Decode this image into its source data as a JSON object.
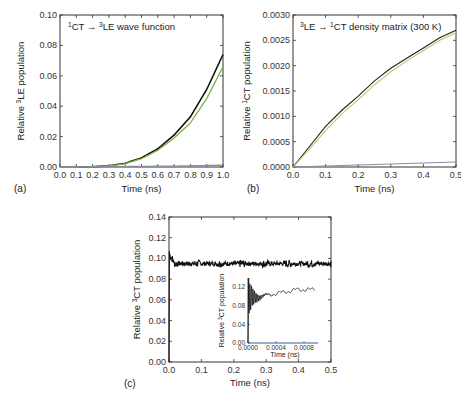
{
  "chart_data": [
    {
      "panel": "(a)",
      "type": "line",
      "title": "1CT → 3LE wave function",
      "title_parts": {
        "sup1": "1",
        "main1": "CT",
        "arrow": "→",
        "sup2": "3",
        "main2": "LE wave function"
      },
      "xlabel": "Time (ns)",
      "ylabel": "Relative 3LE population",
      "ylabel_parts": {
        "pre": "Relative ",
        "sup": "3",
        "post": "LE population"
      },
      "xlim": [
        0.0,
        1.0
      ],
      "ylim": [
        0.0,
        0.1
      ],
      "xticks": [
        "0.0",
        "0.1",
        "0.2",
        "0.3",
        "0.4",
        "0.5",
        "0.6",
        "0.7",
        "0.8",
        "0.9",
        "1.0"
      ],
      "yticks": [
        "0.00",
        "0.02",
        "0.04",
        "0.06",
        "0.08",
        "0.10"
      ],
      "grid": false,
      "x": [
        0.0,
        0.1,
        0.2,
        0.3,
        0.4,
        0.5,
        0.6,
        0.7,
        0.8,
        0.9,
        1.0
      ],
      "series": [
        {
          "name": "black",
          "color": "#111111",
          "values": [
            0.0,
            0.0,
            0.0002,
            0.0008,
            0.0025,
            0.006,
            0.012,
            0.021,
            0.033,
            0.051,
            0.074
          ]
        },
        {
          "name": "green",
          "color": "#7cb342",
          "values": [
            0.0,
            0.0,
            0.0002,
            0.0007,
            0.0022,
            0.0055,
            0.011,
            0.019,
            0.029,
            0.045,
            0.066
          ]
        },
        {
          "name": "gray-baseline",
          "color": "#8a8fa0",
          "values": [
            0.0,
            0.0,
            0.0001,
            0.0002,
            0.0003,
            0.0004,
            0.0005,
            0.0006,
            0.0008,
            0.001,
            0.0012
          ]
        }
      ]
    },
    {
      "panel": "(b)",
      "type": "line",
      "title": "3LE → 1CT density matrix (300 K)",
      "title_parts": {
        "sup1": "3",
        "main1": "LE",
        "arrow": "→",
        "sup2": "1",
        "main2": "CT density matrix (300 K)"
      },
      "xlabel": "Time (ns)",
      "ylabel": "Relative 1CT population",
      "ylabel_parts": {
        "pre": "Relative ",
        "sup": "1",
        "post": "CT population"
      },
      "xlim": [
        0.0,
        0.5
      ],
      "ylim": [
        0.0,
        0.003
      ],
      "xticks": [
        "0.0",
        "0.1",
        "0.2",
        "0.3",
        "0.4",
        "0.5"
      ],
      "yticks": [
        "0.0000",
        "0.0005",
        "0.0010",
        "0.0015",
        "0.0020",
        "0.0025",
        "0.0030"
      ],
      "grid": false,
      "x": [
        0.0,
        0.05,
        0.1,
        0.15,
        0.2,
        0.25,
        0.3,
        0.35,
        0.4,
        0.45,
        0.5
      ],
      "series": [
        {
          "name": "black",
          "color": "#222222",
          "values": [
            0.0,
            0.0004,
            0.0008,
            0.00112,
            0.0014,
            0.0017,
            0.00195,
            0.00215,
            0.00235,
            0.00255,
            0.0027
          ]
        },
        {
          "name": "yellow-green",
          "color": "#b5c96a",
          "values": [
            0.0,
            0.00035,
            0.00072,
            0.00105,
            0.00133,
            0.00162,
            0.00188,
            0.0021,
            0.0023,
            0.0025,
            0.00265
          ]
        },
        {
          "name": "gray-baseline",
          "color": "#8a8fa0",
          "values": [
            0.0,
            1e-05,
            2e-05,
            3e-05,
            4e-05,
            5e-05,
            6e-05,
            7e-05,
            8e-05,
            9e-05,
            0.0001
          ]
        }
      ]
    },
    {
      "panel": "(c)",
      "type": "line",
      "xlabel": "Time (ns)",
      "ylabel": "Relative 3CT population",
      "ylabel_parts": {
        "pre": "Relative ",
        "sup": "3",
        "post": "CT population"
      },
      "xlim": [
        0.0,
        0.5
      ],
      "ylim": [
        0.0,
        0.14
      ],
      "xticks": [
        "0.0",
        "0.1",
        "0.2",
        "0.3",
        "0.4",
        "0.5"
      ],
      "yticks": [
        "0.00",
        "0.02",
        "0.04",
        "0.06",
        "0.08",
        "0.10",
        "0.12",
        "0.14"
      ],
      "grid": false,
      "series": [
        {
          "name": "black",
          "color": "#111111",
          "description": "rapid rise at t≈0 to ~0.105 then fluctuates around 0.095 to 0.5 ns",
          "x": [
            0.0,
            0.002,
            0.01,
            0.05,
            0.1,
            0.2,
            0.3,
            0.4,
            0.5
          ],
          "values": [
            0.0,
            0.105,
            0.097,
            0.095,
            0.095,
            0.095,
            0.095,
            0.095,
            0.095
          ]
        }
      ],
      "inset": {
        "type": "line",
        "xlabel": "Time (ns)",
        "ylabel": "Relative 3CT population",
        "ylabel_parts": {
          "pre": "Relative ",
          "sup": "3",
          "post": "CT population"
        },
        "xlim": [
          0.0,
          0.001
        ],
        "ylim": [
          0.0,
          0.14
        ],
        "xticks": [
          "0.0000",
          "0.0004",
          "0.0008"
        ],
        "yticks": [
          "0.00",
          "0.04",
          "0.08",
          "0.12"
        ],
        "series": [
          {
            "name": "black",
            "color": "#111111",
            "description": "large damped oscillations between ~0.06 and ~0.14 near t=0 settling to ~0.10-0.12",
            "x": [
              0.0,
              3e-05,
              6e-05,
              0.0001,
              0.0002,
              0.0003,
              0.0004,
              0.0005,
              0.0006,
              0.0007,
              0.0008,
              0.0009,
              0.00095
            ],
            "values": [
              0.0,
              0.14,
              0.06,
              0.12,
              0.09,
              0.1,
              0.1,
              0.11,
              0.11,
              0.115,
              0.115,
              0.118,
              0.113
            ]
          }
        ]
      }
    }
  ]
}
